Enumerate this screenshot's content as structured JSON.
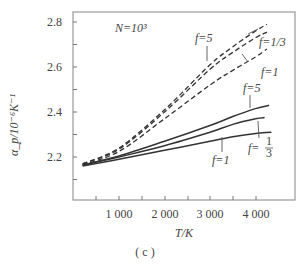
{
  "chart_data": {
    "type": "line",
    "title": "",
    "caption": "( c )",
    "annotation": "N=10³",
    "xlabel": "T/K",
    "ylabel": "α_p/10⁻⁶K⁻¹",
    "xlim": [
      0,
      4900
    ],
    "ylim": [
      2.01,
      2.84
    ],
    "x_ticks": [
      1000,
      2000,
      3000,
      4000
    ],
    "x_tick_labels": [
      "1 000",
      "2 000",
      "3 000",
      "4 000"
    ],
    "y_ticks": [
      2.2,
      2.4,
      2.6,
      2.8
    ],
    "y_tick_labels": [
      "2.2",
      "2.4",
      "2.6",
      "2.8"
    ],
    "grid": false,
    "legend": "inline annotations",
    "series": [
      {
        "name": "f=5 (dashed)",
        "style": "dashed",
        "x": [
          200,
          1000,
          2000,
          3000,
          3500,
          4000,
          4250
        ],
        "y": [
          2.17,
          2.24,
          2.41,
          2.61,
          2.69,
          2.76,
          2.79
        ]
      },
      {
        "name": "f=1/3 (dashed)",
        "style": "dashed",
        "x": [
          200,
          1000,
          2000,
          3000,
          3500,
          4000,
          4250
        ],
        "y": [
          2.17,
          2.235,
          2.4,
          2.59,
          2.665,
          2.73,
          2.755
        ]
      },
      {
        "name": "f=1 (dashed)",
        "style": "dashed",
        "x": [
          200,
          1000,
          2000,
          3000,
          3500,
          4000,
          4250
        ],
        "y": [
          2.165,
          2.225,
          2.37,
          2.52,
          2.585,
          2.645,
          2.68
        ]
      },
      {
        "name": "f=5 (solid)",
        "style": "solid",
        "x": [
          200,
          1000,
          2000,
          3000,
          3500,
          4000,
          4300
        ],
        "y": [
          2.165,
          2.205,
          2.27,
          2.34,
          2.38,
          2.415,
          2.43
        ]
      },
      {
        "name": "f=1/3 (solid)",
        "style": "solid",
        "x": [
          200,
          1000,
          2000,
          3000,
          3500,
          4000,
          4200
        ],
        "y": [
          2.163,
          2.2,
          2.25,
          2.31,
          2.345,
          2.37,
          2.375
        ]
      },
      {
        "name": "f=1 (solid)",
        "style": "solid",
        "x": [
          200,
          1000,
          2000,
          3000,
          3500,
          4000,
          4350
        ],
        "y": [
          2.16,
          2.19,
          2.23,
          2.27,
          2.29,
          2.305,
          2.31
        ]
      }
    ],
    "labels": {
      "dashed_f5": "f=5",
      "dashed_f13": "f=1/3",
      "dashed_f1": "f=1",
      "solid_f5": "f=5",
      "solid_f13_num": "1",
      "solid_f13_den": "3",
      "solid_f13_prefix": "f=",
      "solid_f1": "f=1"
    }
  }
}
